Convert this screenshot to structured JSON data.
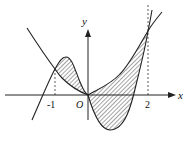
{
  "figure": {
    "type": "function-area-diagram",
    "axes": {
      "x_label": "x",
      "y_label": "y",
      "origin_label": "O"
    },
    "tick_labels": {
      "neg_one": "-1",
      "two": "2"
    },
    "intersections_x": [
      -1,
      0,
      2
    ],
    "colors": {
      "stroke": "#222222",
      "hatch": "#333333",
      "background": "#ffffff"
    }
  }
}
